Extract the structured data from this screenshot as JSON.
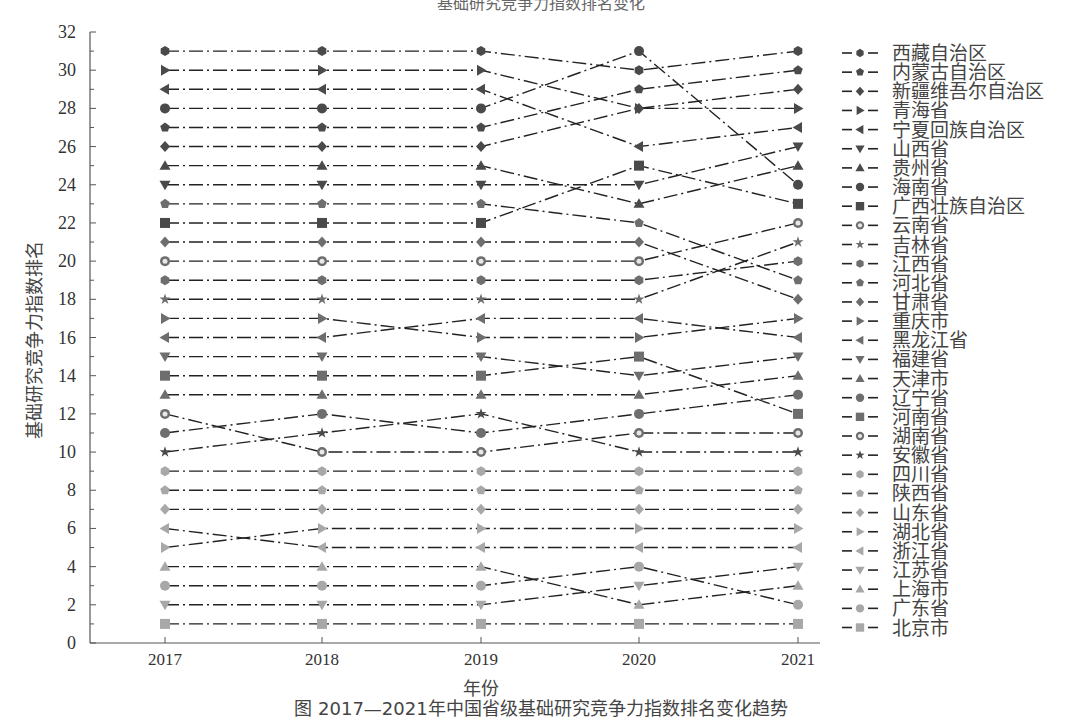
{
  "header": {
    "title_partial": "基础研究竞争力指数排名变化"
  },
  "caption": {
    "text": "图  2017—2021年中国省级基础研究竞争力指数排名变化趋势"
  },
  "chart_data": {
    "type": "line",
    "title": "",
    "xlabel": "年份",
    "ylabel": "基础研究竞争力指数排名",
    "x": [
      2017,
      2018,
      2019,
      2020,
      2021
    ],
    "x_tick_labels": [
      "2017",
      "2018",
      "2019",
      "2020",
      "2021"
    ],
    "ylim": [
      0,
      32
    ],
    "y_ticks": [
      0,
      2,
      4,
      6,
      8,
      10,
      12,
      14,
      16,
      18,
      20,
      22,
      24,
      26,
      28,
      30,
      32
    ],
    "grid": false,
    "legend_position": "right",
    "line_style": "dash-dot",
    "series": [
      {
        "name": "西藏自治区",
        "marker": "hexagon",
        "shade": "dark",
        "values": [
          31,
          31,
          31,
          30,
          31
        ]
      },
      {
        "name": "内蒙古自治区",
        "marker": "pentagon",
        "shade": "dark",
        "values": [
          27,
          27,
          27,
          29,
          30
        ]
      },
      {
        "name": "新疆维吾尔自治区",
        "marker": "diamond",
        "shade": "dark",
        "values": [
          26,
          26,
          26,
          28,
          29
        ]
      },
      {
        "name": "青海省",
        "marker": "triangle-right",
        "shade": "dark",
        "values": [
          30,
          30,
          30,
          28,
          28
        ]
      },
      {
        "name": "宁夏回族自治区",
        "marker": "triangle-left",
        "shade": "dark",
        "values": [
          29,
          29,
          29,
          26,
          27
        ]
      },
      {
        "name": "山西省",
        "marker": "triangle-down",
        "shade": "dark",
        "values": [
          24,
          24,
          24,
          24,
          26
        ]
      },
      {
        "name": "贵州省",
        "marker": "triangle-up",
        "shade": "dark",
        "values": [
          25,
          25,
          25,
          23,
          25
        ]
      },
      {
        "name": "海南省",
        "marker": "circle",
        "shade": "dark",
        "values": [
          28,
          28,
          28,
          31,
          24
        ]
      },
      {
        "name": "广西壮族自治区",
        "marker": "square",
        "shade": "dark",
        "values": [
          22,
          22,
          22,
          25,
          23
        ]
      },
      {
        "name": "云南省",
        "marker": "ring",
        "shade": "mid",
        "values": [
          20,
          20,
          20,
          20,
          22
        ]
      },
      {
        "name": "吉林省",
        "marker": "star",
        "shade": "mid",
        "values": [
          18,
          18,
          18,
          18,
          21
        ]
      },
      {
        "name": "江西省",
        "marker": "hexagon",
        "shade": "mid",
        "values": [
          19,
          19,
          19,
          19,
          20
        ]
      },
      {
        "name": "河北省",
        "marker": "pentagon",
        "shade": "mid",
        "values": [
          23,
          23,
          23,
          22,
          19
        ]
      },
      {
        "name": "甘肃省",
        "marker": "diamond",
        "shade": "mid",
        "values": [
          21,
          21,
          21,
          21,
          18
        ]
      },
      {
        "name": "重庆市",
        "marker": "triangle-right",
        "shade": "mid",
        "values": [
          17,
          17,
          16,
          16,
          17
        ]
      },
      {
        "name": "黑龙江省",
        "marker": "triangle-left",
        "shade": "mid",
        "values": [
          16,
          16,
          17,
          17,
          16
        ]
      },
      {
        "name": "福建省",
        "marker": "triangle-down",
        "shade": "mid",
        "values": [
          15,
          15,
          15,
          14,
          15
        ]
      },
      {
        "name": "天津市",
        "marker": "triangle-up",
        "shade": "mid",
        "values": [
          13,
          13,
          13,
          13,
          14
        ]
      },
      {
        "name": "辽宁省",
        "marker": "circle",
        "shade": "mid",
        "values": [
          11,
          12,
          11,
          12,
          13
        ]
      },
      {
        "name": "河南省",
        "marker": "square",
        "shade": "mid",
        "values": [
          14,
          14,
          14,
          15,
          12
        ]
      },
      {
        "name": "湖南省",
        "marker": "ring",
        "shade": "mid",
        "values": [
          12,
          10,
          10,
          11,
          11
        ]
      },
      {
        "name": "安徽省",
        "marker": "star",
        "shade": "dark",
        "values": [
          10,
          11,
          12,
          10,
          10
        ]
      },
      {
        "name": "四川省",
        "marker": "hexagon",
        "shade": "light",
        "values": [
          9,
          9,
          9,
          9,
          9
        ]
      },
      {
        "name": "陕西省",
        "marker": "pentagon",
        "shade": "light",
        "values": [
          8,
          8,
          8,
          8,
          8
        ]
      },
      {
        "name": "山东省",
        "marker": "diamond",
        "shade": "light",
        "values": [
          7,
          7,
          7,
          7,
          7
        ]
      },
      {
        "name": "湖北省",
        "marker": "triangle-right",
        "shade": "light",
        "values": [
          5,
          6,
          6,
          6,
          6
        ]
      },
      {
        "name": "浙江省",
        "marker": "triangle-left",
        "shade": "light",
        "values": [
          6,
          5,
          5,
          5,
          5
        ]
      },
      {
        "name": "江苏省",
        "marker": "triangle-down",
        "shade": "light",
        "values": [
          2,
          2,
          2,
          3,
          4
        ]
      },
      {
        "name": "上海市",
        "marker": "triangle-up",
        "shade": "light",
        "values": [
          4,
          4,
          4,
          2,
          3
        ]
      },
      {
        "name": "广东省",
        "marker": "circle",
        "shade": "light",
        "values": [
          3,
          3,
          3,
          4,
          2
        ]
      },
      {
        "name": "北京市",
        "marker": "square",
        "shade": "light",
        "values": [
          1,
          1,
          1,
          1,
          1
        ]
      }
    ]
  },
  "colors": {
    "dark": "#4a4a4a",
    "mid": "#6e6e6e",
    "light": "#a8a8a8",
    "line": "#222222",
    "axis": "#555555",
    "ring_inner": "#e8e8e8"
  }
}
